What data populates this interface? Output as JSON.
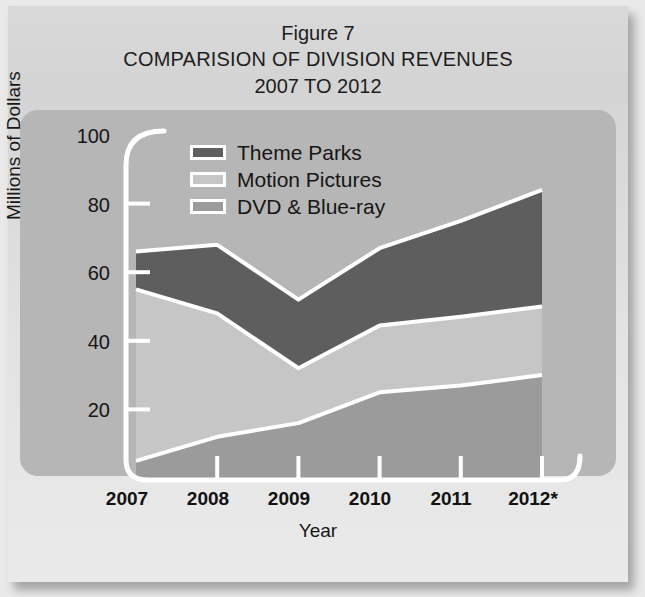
{
  "top_cropped_text": "",
  "figure": {
    "figure_number": "Figure 7",
    "title_line_1": "COMPARISION OF DIVISION REVENUES",
    "title_line_2": "2007 TO 2012"
  },
  "legend": {
    "position": "inside-top-left",
    "items": [
      {
        "label": "Theme Parks",
        "color": "#5e5e5e"
      },
      {
        "label": "Motion Pictures",
        "color": "#c4c4c4"
      },
      {
        "label": "DVD & Blue-ray",
        "color": "#9a9a9a"
      }
    ]
  },
  "axes": {
    "y_title": "Millions of Dollars",
    "x_title": "Year",
    "y_ticks": [
      "20",
      "40",
      "60",
      "80",
      "100"
    ],
    "x_ticks": [
      "2007",
      "2008",
      "2009",
      "2010",
      "2011",
      "2012*"
    ]
  },
  "colors": {
    "panel_background": "#b6b6b6",
    "card_background": "#dddddd",
    "axis_line": "#ffffff",
    "text": "#151515",
    "theme_parks": "#5e5e5e",
    "motion_pictures": "#c4c4c4",
    "dvd_blueray": "#9a9a9a"
  },
  "chart_data": {
    "type": "area",
    "stacked": true,
    "title": "COMPARISION OF DIVISION REVENUES 2007 TO 2012",
    "subtitle": "Figure 7",
    "xlabel": "Year",
    "ylabel": "Millions of Dollars",
    "categories": [
      "2007",
      "2008",
      "2009",
      "2010",
      "2011",
      "2012*"
    ],
    "ylim": [
      0,
      100
    ],
    "xlim": [
      2007,
      2012
    ],
    "grid": false,
    "legend_position": "upper left",
    "y_tick_values": [
      20,
      40,
      60,
      80,
      100
    ],
    "series": [
      {
        "name": "DVD & Blue-ray",
        "color": "#9a9a9a",
        "values": [
          5,
          12,
          16,
          25,
          27,
          30
        ]
      },
      {
        "name": "Motion Pictures",
        "color": "#c4c4c4",
        "values": [
          50,
          36,
          16,
          19.5,
          20,
          20
        ]
      },
      {
        "name": "Theme Parks",
        "color": "#5e5e5e",
        "values": [
          11,
          20,
          20,
          22.5,
          28,
          34
        ]
      }
    ],
    "cumulative_tops": {
      "dvd_blueray": [
        5,
        12,
        16,
        25,
        27,
        30
      ],
      "motion_pictures": [
        55,
        48,
        32,
        44.5,
        47,
        50
      ],
      "theme_parks_total": [
        66,
        68,
        52,
        67,
        75,
        84
      ]
    },
    "annotations": [
      "* 2012 value is projected, indicated by asterisk on axis label"
    ]
  }
}
